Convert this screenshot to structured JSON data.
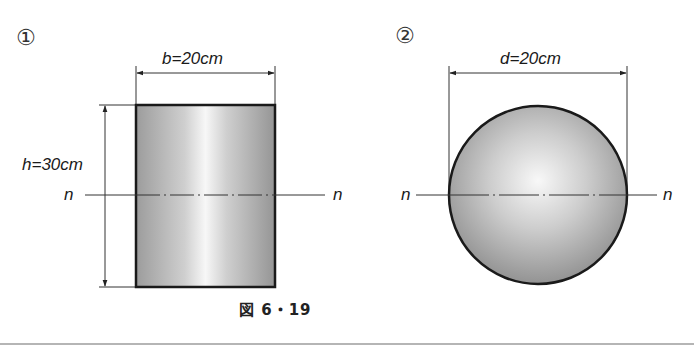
{
  "figure": {
    "caption": "図 6・19",
    "panels": [
      {
        "marker": "①",
        "shape": "rectangle",
        "width_label": "b=20cm",
        "height_label": "h=30cm",
        "axis_label_left": "n",
        "axis_label_right": "n"
      },
      {
        "marker": "②",
        "shape": "circle",
        "diameter_label": "d=20cm",
        "axis_label_left": "n",
        "axis_label_right": "n"
      }
    ]
  },
  "colors": {
    "outline": "#1a1a1a",
    "fill_dark": "#9a9a9a",
    "fill_light": "#f5f5f5",
    "dimension_line": "#333333",
    "rule": "#b5b5b5"
  }
}
